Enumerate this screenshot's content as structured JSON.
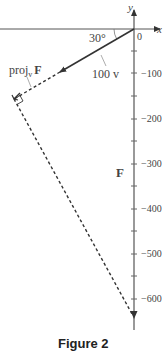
{
  "diagram": {
    "axes": {
      "x_label": "x",
      "y_label": "y",
      "origin_label": "0",
      "y_ticks": [
        "−100",
        "−200",
        "−300",
        "−400",
        "−500",
        "−600"
      ]
    },
    "angle_label": "30°",
    "vector_v_label": "100 v",
    "projection_label_main": "proj",
    "projection_label_sub": "v",
    "projection_label_vec": "F",
    "force_label": "F",
    "caption": "Figure 2"
  }
}
